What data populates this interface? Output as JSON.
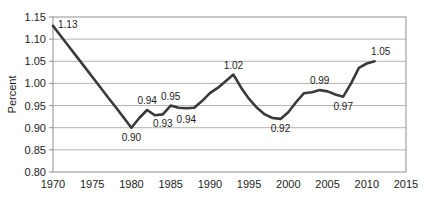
{
  "chart_data": {
    "type": "line",
    "title": "",
    "xlabel": "",
    "ylabel": "Percent",
    "xlim": [
      1970,
      2015
    ],
    "ylim": [
      0.8,
      1.15
    ],
    "x_ticks": [
      "1970",
      "1975",
      "1980",
      "1985",
      "1990",
      "1995",
      "2000",
      "2005",
      "2010",
      "2015"
    ],
    "y_ticks": [
      "0.80",
      "0.85",
      "0.90",
      "0.95",
      "1.00",
      "1.05",
      "1.10",
      "1.15"
    ],
    "grid": "horizontal",
    "legend": "none",
    "colors": {
      "line": "#3a3a3a",
      "grid": "#b3b3b3",
      "frame": "#8f8f8f",
      "text": "#1d1d1d",
      "background": "#ffffff"
    },
    "series": [
      {
        "name": "Percent",
        "x": [
          1970,
          1971,
          1972,
          1973,
          1974,
          1975,
          1976,
          1977,
          1978,
          1979,
          1980,
          1981,
          1982,
          1983,
          1984,
          1985,
          1986,
          1987,
          1988,
          1989,
          1990,
          1991,
          1992,
          1993,
          1994,
          1995,
          1996,
          1997,
          1998,
          1999,
          2000,
          2001,
          2002,
          2003,
          2004,
          2005,
          2006,
          2007,
          2008,
          2009,
          2010,
          2011
        ],
        "values": [
          1.13,
          1.107,
          1.084,
          1.061,
          1.038,
          1.015,
          0.992,
          0.969,
          0.946,
          0.923,
          0.9,
          0.922,
          0.94,
          0.928,
          0.93,
          0.95,
          0.945,
          0.944,
          0.945,
          0.96,
          0.978,
          0.99,
          1.005,
          1.02,
          0.99,
          0.965,
          0.945,
          0.93,
          0.922,
          0.92,
          0.935,
          0.958,
          0.978,
          0.98,
          0.985,
          0.982,
          0.975,
          0.97,
          1.0,
          1.035,
          1.045,
          1.05
        ]
      }
    ],
    "annotations": [
      {
        "x": 1970,
        "y": 1.13,
        "text": "1.13",
        "pos": "right"
      },
      {
        "x": 1980,
        "y": 0.9,
        "text": "0.90",
        "pos": "below"
      },
      {
        "x": 1982,
        "y": 0.94,
        "text": "0.94",
        "pos": "above"
      },
      {
        "x": 1984,
        "y": 0.93,
        "text": "0.93",
        "pos": "below"
      },
      {
        "x": 1985,
        "y": 0.95,
        "text": "0.95",
        "pos": "above"
      },
      {
        "x": 1987,
        "y": 0.94,
        "text": "0.94",
        "pos": "below"
      },
      {
        "x": 1993,
        "y": 1.02,
        "text": "1.02",
        "pos": "above"
      },
      {
        "x": 1999,
        "y": 0.92,
        "text": "0.92",
        "pos": "below"
      },
      {
        "x": 2004,
        "y": 0.985,
        "text": "0.99",
        "pos": "above"
      },
      {
        "x": 2007,
        "y": 0.97,
        "text": "0.97",
        "pos": "below"
      },
      {
        "x": 2011,
        "y": 1.05,
        "text": "1.05",
        "pos": "above",
        "dx": 6
      }
    ]
  }
}
